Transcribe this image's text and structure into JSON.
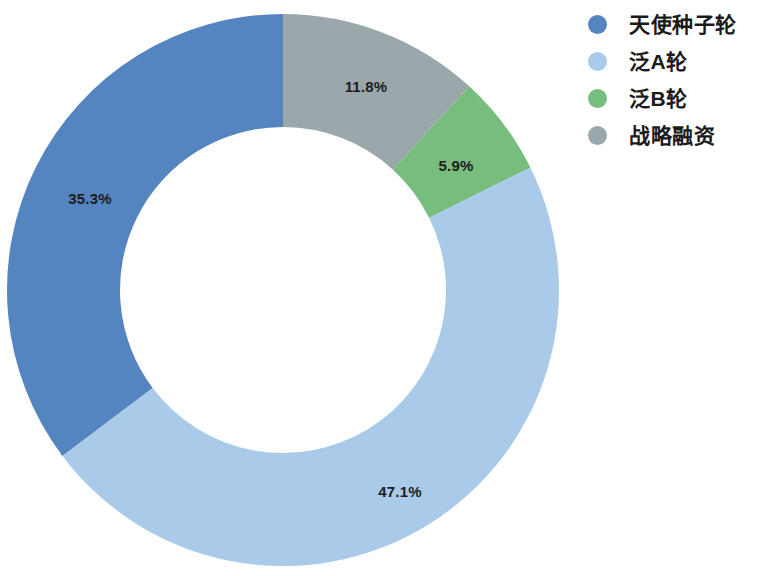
{
  "chart_data": {
    "type": "pie",
    "variant": "donut",
    "title": "",
    "subtitle": "",
    "xlabel": "",
    "ylabel": "",
    "legend_position": "right",
    "grid": false,
    "start_angle_deg": 90,
    "direction": "counterclockwise",
    "center": {
      "x": 283,
      "y": 290
    },
    "outer_radius": 276,
    "inner_radius": 163,
    "categories": [
      "天使种子轮",
      "泛A轮",
      "泛B轮",
      "战略融资"
    ],
    "values": [
      35.3,
      47.1,
      5.9,
      11.8
    ],
    "value_unit": "%",
    "colors": [
      "#5585c0",
      "#a9cbe9",
      "#76bd7e",
      "#9aa8ac"
    ],
    "slices": [
      {
        "label": "天使种子轮",
        "value": 35.3,
        "display": "35.3%",
        "color": "#5585c0",
        "label_x": 90,
        "label_y": 198
      },
      {
        "label": "泛A轮",
        "value": 47.1,
        "display": "47.1%",
        "color": "#a9cbe9",
        "label_x": 400,
        "label_y": 491
      },
      {
        "label": "泛B轮",
        "value": 5.9,
        "display": "5.9%",
        "color": "#76bd7e",
        "label_x": 456,
        "label_y": 165
      },
      {
        "label": "战略融资",
        "value": 11.8,
        "display": "11.8%",
        "color": "#9aa8ac",
        "label_x": 366,
        "label_y": 86
      }
    ]
  },
  "legend": {
    "items": [
      {
        "label": "天使种子轮",
        "color": "#5585c0",
        "swatch_name": "legend-swatch-angel-seed"
      },
      {
        "label": "泛A轮",
        "color": "#a9cbe9",
        "swatch_name": "legend-swatch-series-a"
      },
      {
        "label": "泛B轮",
        "color": "#76bd7e",
        "swatch_name": "legend-swatch-series-b"
      },
      {
        "label": "战略融资",
        "color": "#9aa8ac",
        "swatch_name": "legend-swatch-strategic"
      }
    ]
  },
  "colors": {
    "background": "#ffffff",
    "text": "#1a1a1a",
    "slice_dark_blue": "#5585c0",
    "slice_light_blue": "#a9cbe9",
    "slice_green": "#76bd7e",
    "slice_gray": "#9aa8ac"
  }
}
